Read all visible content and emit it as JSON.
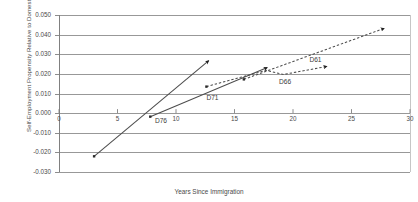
{
  "chart_data": {
    "type": "line",
    "title": "",
    "xlabel": "Years Since Immigration",
    "ylabel": "Self-Employment Propensity Relative to Domestic",
    "xlim": [
      0,
      30
    ],
    "ylim": [
      -0.03,
      0.05
    ],
    "xticks": [
      "0",
      "5",
      "10",
      "15",
      "20",
      "25",
      "30"
    ],
    "yticks": [
      "0.050",
      "0.040",
      "0.030",
      "0.020",
      "0.010",
      "0.000",
      "-0.010",
      "-0.020",
      "-0.030"
    ],
    "grid": "horizontal",
    "legend_position": "inline-annotations",
    "series": [
      {
        "name": "D76",
        "style": "solid",
        "marker_end": "arrow",
        "color": "#4d4d4d",
        "label_x": 8.2,
        "label_y": -0.0042,
        "points": [
          [
            3.0,
            -0.022
          ],
          [
            12.8,
            0.0268
          ]
        ]
      },
      {
        "name": "D71",
        "style": "solid",
        "marker_end": "arrow",
        "color": "#4d4d4d",
        "label_x": 12.6,
        "label_y": 0.0078,
        "points": [
          [
            7.8,
            -0.0018
          ],
          [
            17.8,
            0.0232
          ]
        ]
      },
      {
        "name": "D66",
        "style": "dashed",
        "marker_end": "arrow",
        "color": "#4d4d4d",
        "label_x": 18.8,
        "label_y": 0.0158,
        "points": [
          [
            12.6,
            0.0135
          ],
          [
            17.7,
            0.0218
          ],
          [
            19.2,
            0.0197
          ],
          [
            22.9,
            0.0238
          ]
        ]
      },
      {
        "name": "D61",
        "style": "dashed",
        "marker_end": "arrow",
        "color": "#4d4d4d",
        "label_x": 21.4,
        "label_y": 0.0272,
        "points": [
          [
            15.8,
            0.0172
          ],
          [
            27.8,
            0.0432
          ]
        ]
      }
    ]
  },
  "axis_color": "#808080",
  "grid_color": "#8c8c8c"
}
